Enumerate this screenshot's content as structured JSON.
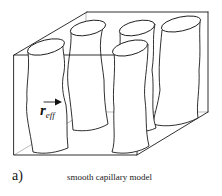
{
  "figure": {
    "panel_label": "a)",
    "caption": "smooth capillary model",
    "annotation": {
      "symbol": "r",
      "subscript": "eff",
      "arrow": "arrow-right"
    },
    "box": {
      "front_face": {
        "x1": 14,
        "y1": 55,
        "x2": 137,
        "y2": 155
      },
      "depth_offset": {
        "dx": 72,
        "dy": -43
      }
    },
    "capillaries": [
      {
        "name": "front-left"
      },
      {
        "name": "back-left"
      },
      {
        "name": "back-middle"
      },
      {
        "name": "back-right"
      },
      {
        "name": "front-right"
      }
    ],
    "colors": {
      "stroke": "#1a1a1a",
      "background": "#ffffff"
    }
  }
}
